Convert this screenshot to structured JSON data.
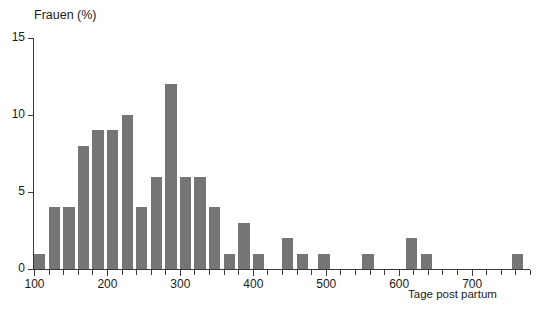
{
  "chart_data": {
    "type": "bar",
    "title": "",
    "xlabel": "Tage post partum",
    "ylabel": "Frauen (%)",
    "xlim": [
      100,
      780
    ],
    "ylim": [
      0,
      15
    ],
    "grid": false,
    "legend": null,
    "bar_width_days": 20,
    "x_tick_step": 20,
    "x_major_ticks": [
      100,
      200,
      300,
      400,
      500,
      600,
      700
    ],
    "x_tick_labels": [
      "100",
      "200",
      "300",
      "400",
      "500",
      "600",
      "700"
    ],
    "y_ticks": [
      0,
      5,
      10,
      15
    ],
    "y_tick_labels": [
      "0",
      "5",
      "10",
      "15"
    ],
    "bar_color": "#757575",
    "axis_color": "#3a3a3a",
    "background_color": "#ffffff",
    "bins": [
      {
        "x_start": 100,
        "x_end": 120,
        "center": 110,
        "value": 1
      },
      {
        "x_start": 120,
        "x_end": 140,
        "center": 130,
        "value": 4
      },
      {
        "x_start": 140,
        "x_end": 160,
        "center": 150,
        "value": 4
      },
      {
        "x_start": 160,
        "x_end": 180,
        "center": 170,
        "value": 8
      },
      {
        "x_start": 180,
        "x_end": 200,
        "center": 190,
        "value": 9
      },
      {
        "x_start": 200,
        "x_end": 220,
        "center": 210,
        "value": 9
      },
      {
        "x_start": 220,
        "x_end": 240,
        "center": 230,
        "value": 10
      },
      {
        "x_start": 240,
        "x_end": 260,
        "center": 250,
        "value": 4
      },
      {
        "x_start": 260,
        "x_end": 280,
        "center": 270,
        "value": 6
      },
      {
        "x_start": 280,
        "x_end": 300,
        "center": 290,
        "value": 12
      },
      {
        "x_start": 300,
        "x_end": 320,
        "center": 310,
        "value": 6
      },
      {
        "x_start": 320,
        "x_end": 340,
        "center": 330,
        "value": 6
      },
      {
        "x_start": 340,
        "x_end": 360,
        "center": 350,
        "value": 4
      },
      {
        "x_start": 360,
        "x_end": 380,
        "center": 370,
        "value": 1
      },
      {
        "x_start": 380,
        "x_end": 400,
        "center": 390,
        "value": 3
      },
      {
        "x_start": 400,
        "x_end": 420,
        "center": 410,
        "value": 1
      },
      {
        "x_start": 440,
        "x_end": 460,
        "center": 450,
        "value": 2
      },
      {
        "x_start": 460,
        "x_end": 480,
        "center": 470,
        "value": 1
      },
      {
        "x_start": 490,
        "x_end": 510,
        "center": 500,
        "value": 1
      },
      {
        "x_start": 550,
        "x_end": 570,
        "center": 560,
        "value": 1
      },
      {
        "x_start": 610,
        "x_end": 630,
        "center": 620,
        "value": 2
      },
      {
        "x_start": 630,
        "x_end": 650,
        "center": 640,
        "value": 1
      },
      {
        "x_start": 755,
        "x_end": 775,
        "center": 765,
        "value": 1
      }
    ],
    "categories": [
      110,
      130,
      150,
      170,
      190,
      210,
      230,
      250,
      270,
      290,
      310,
      330,
      350,
      370,
      390,
      410,
      450,
      470,
      500,
      560,
      620,
      640,
      765
    ],
    "values": [
      1,
      4,
      4,
      8,
      9,
      9,
      10,
      4,
      6,
      12,
      6,
      6,
      4,
      1,
      3,
      1,
      2,
      1,
      1,
      1,
      2,
      1,
      1
    ]
  }
}
